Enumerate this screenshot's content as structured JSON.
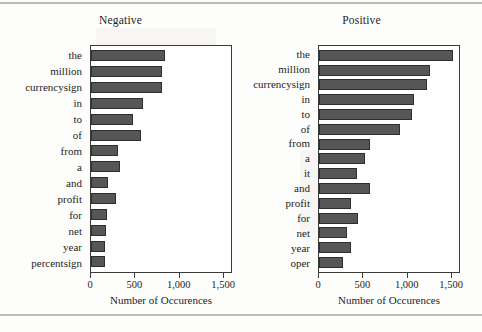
{
  "chart_data": [
    {
      "type": "bar",
      "orientation": "horizontal",
      "title": "Negative",
      "xlabel": "Number of Occurences",
      "ylabel": "",
      "xlim": [
        0,
        1600
      ],
      "xticks": [
        0,
        500,
        1000,
        1500
      ],
      "xticklabels": [
        "0",
        "500",
        "1,000",
        "1,500"
      ],
      "grid": false,
      "legend": false,
      "categories": [
        "the",
        "million",
        "currencysign",
        "in",
        "to",
        "of",
        "from",
        "a",
        "and",
        "profit",
        "for",
        "net",
        "year",
        "percentsign"
      ],
      "values": [
        833,
        800,
        795,
        585,
        473,
        563,
        304,
        327,
        192,
        281,
        180,
        169,
        157,
        157
      ]
    },
    {
      "type": "bar",
      "orientation": "horizontal",
      "title": "Positive",
      "xlabel": "Number of Occurences",
      "ylabel": "",
      "xlim": [
        0,
        1600
      ],
      "xticks": [
        0,
        500,
        1000,
        1500
      ],
      "xticklabels": [
        "0",
        "500",
        "1,000",
        "1,500"
      ],
      "grid": false,
      "legend": false,
      "categories": [
        "the",
        "million",
        "currencysign",
        "in",
        "to",
        "of",
        "from",
        "a",
        "it",
        "and",
        "profit",
        "for",
        "net",
        "year",
        "oper"
      ],
      "values": [
        1511,
        1250,
        1216,
        1068,
        1045,
        909,
        580,
        523,
        432,
        580,
        364,
        443,
        318,
        364,
        273
      ]
    }
  ],
  "style": {
    "bar_fill": "#565656",
    "bar_stroke": "#2e2e2e",
    "axis_color": "#3a3a3a",
    "text_color": "#1d1d1d",
    "background": "#fdfdfc"
  }
}
